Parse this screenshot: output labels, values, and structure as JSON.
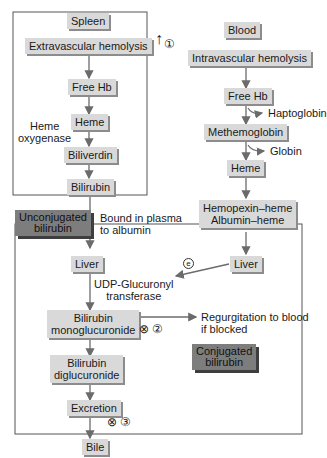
{
  "diagram": {
    "left_column": {
      "spleen": "Spleen",
      "extravascular": "Extravascular hemolysis",
      "free_hb": "Free Hb",
      "heme": "Heme",
      "heme_oxygenase_1": "Heme",
      "heme_oxygenase_2": "oxygenase",
      "biliverdin": "Biliverdin",
      "bilirubin": "Bilirubin",
      "unconjugated_1": "Unconjugated",
      "unconjugated_2": "bilirubin",
      "bound_1": "Bound in plasma",
      "bound_2": "to albumin"
    },
    "right_column": {
      "blood": "Blood",
      "intravascular": "Intravascular hemolysis",
      "free_hb": "Free Hb",
      "haptoglobin": "Haptoglobin",
      "methemoglobin": "Methemoglobin",
      "globin": "Globin",
      "heme": "Heme",
      "hemopexin_1": "Hemopexin–heme",
      "hemopexin_2": "Albumin–heme",
      "liver": "Liver"
    },
    "liver_box": {
      "liver": "Liver",
      "udp_1": "UDP-Glucuronyl",
      "udp_2": "transferase",
      "mono_1": "Bilirubin",
      "mono_2": "monoglucuronide",
      "di_1": "Bilirubin",
      "di_2": "diglucuronide",
      "excretion": "Excretion",
      "bile": "Bile",
      "regurg_1": "Regurgitation to blood",
      "regurg_2": "if blocked",
      "conjugated_1": "Conjugated",
      "conjugated_2": "bilirubin"
    },
    "markers": {
      "increase_arrow": "↑",
      "circle_1": "①",
      "block_2": "⊗",
      "circle_2": "②",
      "block_3": "⊗",
      "circle_3": "③",
      "small_e": "e"
    },
    "colors": {
      "node_fill": "#d9d9d9",
      "node_shadow": "#8c8c8c",
      "dark_fill": "#7d7d7d",
      "dark_shadow": "#3e3e3e",
      "line": "#6b6b6b",
      "frame": "#555555"
    }
  }
}
